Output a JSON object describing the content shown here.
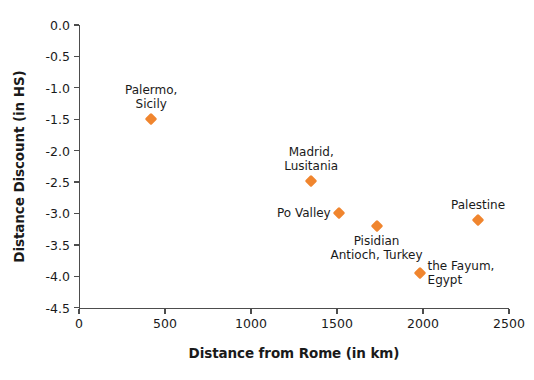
{
  "chart_data": {
    "type": "scatter",
    "title": "",
    "xlabel": "Distance from Rome (in km)",
    "ylabel": "Distance Discount (in HS)",
    "xlim": [
      0,
      2500
    ],
    "ylim": [
      -4.5,
      0.0
    ],
    "xticks": [
      "0",
      "500",
      "1000",
      "1500",
      "2000",
      "2500"
    ],
    "xtick_values": [
      0,
      500,
      1000,
      1500,
      2000,
      2500
    ],
    "yticks": [
      "0.0",
      "-0.5",
      "-1.0",
      "-1.5",
      "-2.0",
      "-2.5",
      "-3.0",
      "-3.5",
      "-4.0",
      "-4.5"
    ],
    "ytick_values": [
      0.0,
      -0.5,
      -1.0,
      -1.5,
      -2.0,
      -2.5,
      -3.0,
      -3.5,
      -4.0,
      -4.5
    ],
    "grid": false,
    "legend": "none",
    "marker_color": "#f0852e",
    "marker_shape": "diamond",
    "points": [
      {
        "label": "Palermo,\nSicily",
        "x": 420,
        "y": -1.5,
        "label_pos": "above",
        "align": "center"
      },
      {
        "label": "Madrid,\nLusitania",
        "x": 1350,
        "y": -2.48,
        "label_pos": "above",
        "align": "center"
      },
      {
        "label": "Po Valley",
        "x": 1510,
        "y": -3.0,
        "label_pos": "left",
        "align": "right"
      },
      {
        "label": "Pisidian\nAntioch, Turkey",
        "x": 1730,
        "y": -3.2,
        "label_pos": "below",
        "align": "center"
      },
      {
        "label": "the Fayum,\nEgypt",
        "x": 1980,
        "y": -3.95,
        "label_pos": "right",
        "align": "left"
      },
      {
        "label": "Palestine",
        "x": 2320,
        "y": -3.1,
        "label_pos": "above",
        "align": "center"
      }
    ]
  }
}
